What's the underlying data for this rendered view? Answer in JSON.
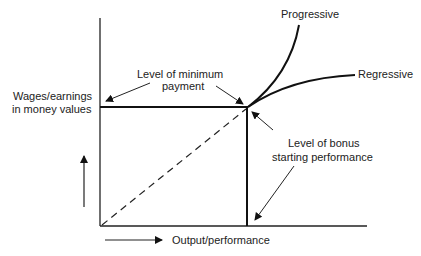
{
  "diagram": {
    "type": "wage-incentive-curve",
    "y_axis_label_line1": "Wages/earnings",
    "y_axis_label_line2": "in money values",
    "x_axis_label": "Output/performance",
    "annotations": {
      "min_payment_line1": "Level of minimum",
      "min_payment_line2": "payment",
      "bonus_start_line1": "Level of bonus",
      "bonus_start_line2": "starting performance"
    },
    "curves": {
      "progressive": "Progressive",
      "regressive": "Regressive"
    }
  }
}
